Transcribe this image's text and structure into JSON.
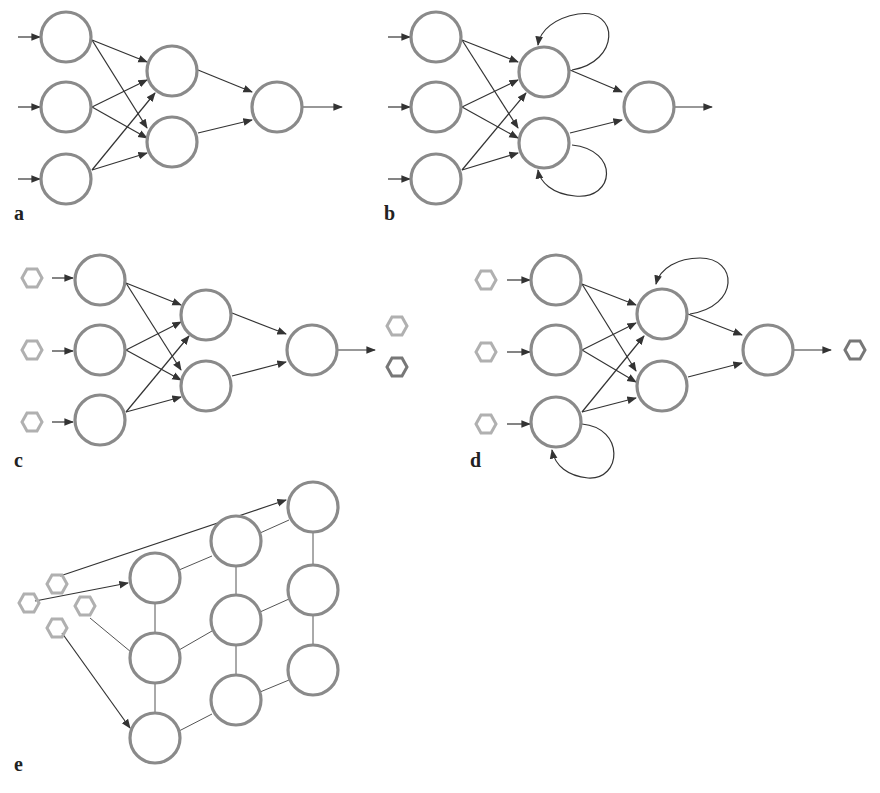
{
  "colors": {
    "node_stroke": "#8a8a8a",
    "edge": "#333333",
    "hex_light": "#b0b0b0",
    "hex_dark": "#777777",
    "label": "#222222"
  },
  "panels": [
    {
      "id": "a",
      "label": "a",
      "label_pos": [
        14,
        219
      ]
    },
    {
      "id": "b",
      "label": "b",
      "label_pos": [
        384,
        219
      ]
    },
    {
      "id": "c",
      "label": "c",
      "label_pos": [
        14,
        466
      ]
    },
    {
      "id": "d",
      "label": "d",
      "label_pos": [
        470,
        466
      ]
    },
    {
      "id": "e",
      "label": "e",
      "label_pos": [
        14,
        770
      ]
    }
  ]
}
